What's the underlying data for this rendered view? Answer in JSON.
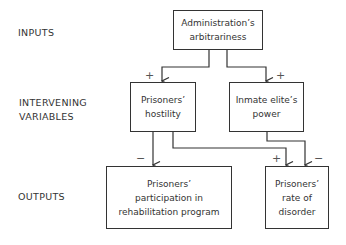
{
  "rows": {
    "inputs": "INPUTS",
    "intervening": "INTERVENING\nVARIABLES",
    "outputs": "OUTPUTS"
  },
  "nodes": {
    "admin": "Administration’s\narbitrariness",
    "hostility": "Prisoners’\nhostility",
    "elite": "Inmate elite’s\npower",
    "participation": "Prisoners’\nparticipation in\nrehabilitation program",
    "disorder": "Prisoners’\nrate of\ndisorder"
  },
  "edges": [
    {
      "from": "admin",
      "to": "hostility",
      "sign": "+"
    },
    {
      "from": "admin",
      "to": "elite",
      "sign": "+"
    },
    {
      "from": "hostility",
      "to": "participation",
      "sign": "−"
    },
    {
      "from": "hostility",
      "to": "disorder",
      "sign": "+"
    },
    {
      "from": "elite",
      "to": "disorder",
      "sign": "−"
    }
  ]
}
